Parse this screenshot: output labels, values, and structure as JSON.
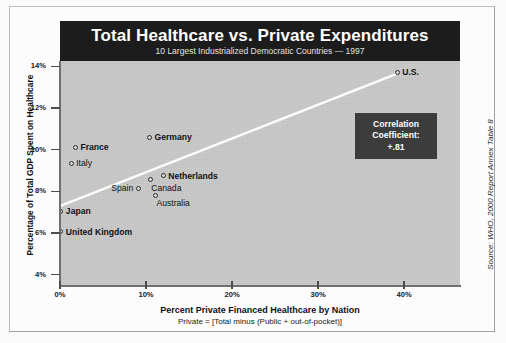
{
  "chart_data": {
    "type": "scatter",
    "title": "Total Healthcare vs. Private Expenditures",
    "subtitle": "10 Largest Industrialized Democratic Countries — 1997",
    "xlabel": "Percent Private Financed Healthcare by Nation",
    "xnote": "Private = [Total minus (Public + out-of-pocket)]",
    "ylabel": "Percentage of Total GDP Spent on Healthcare",
    "source": "Source: WHO, 2000 Report Annex Table 8",
    "xlim": [
      0,
      46.5
    ],
    "ylim": [
      3.5,
      14.25
    ],
    "grid": false,
    "legend": "none",
    "xticks": [
      "0%",
      "10%",
      "20%",
      "30%",
      "40%"
    ],
    "xtick_values": [
      0,
      10,
      20,
      30,
      40
    ],
    "yticks": [
      "4%",
      "6%",
      "8%",
      "10%",
      "12%",
      "14%"
    ],
    "ytick_values": [
      4,
      6,
      8,
      10,
      12,
      14
    ],
    "points": [
      {
        "label": "U.S.",
        "x": 39.2,
        "y": 13.7,
        "bold": true,
        "label_pos": "right"
      },
      {
        "label": "Germany",
        "x": 10.4,
        "y": 10.6,
        "bold": true,
        "label_pos": "right"
      },
      {
        "label": "France",
        "x": 1.8,
        "y": 10.1,
        "bold": true,
        "label_pos": "right"
      },
      {
        "label": "Italy",
        "x": 1.3,
        "y": 9.35,
        "bold": false,
        "label_pos": "right"
      },
      {
        "label": "Netherlands",
        "x": 12.0,
        "y": 8.75,
        "bold": true,
        "label_pos": "right"
      },
      {
        "label": "Canada",
        "x": 10.5,
        "y": 8.55,
        "bold": false,
        "label_pos": "below-right"
      },
      {
        "label": "Spain",
        "x": 9.1,
        "y": 8.15,
        "bold": false,
        "label_pos": "left"
      },
      {
        "label": "Australia",
        "x": 11.1,
        "y": 7.8,
        "bold": false,
        "label_pos": "below-right"
      },
      {
        "label": "Japan",
        "x": 0.1,
        "y": 7.05,
        "bold": true,
        "label_pos": "right"
      },
      {
        "label": "United Kingdom",
        "x": 0.1,
        "y": 6.05,
        "bold": true,
        "label_pos": "right"
      }
    ],
    "trendline": {
      "x0": 0.0,
      "y0": 7.3,
      "x1": 39.2,
      "y1": 13.65
    },
    "annotation": {
      "line1": "Correlation",
      "line2": "Coefficient:",
      "line3": "+.81"
    }
  },
  "colors": {
    "plot_background": "#c9c9c9",
    "title_background": "#1c1c1c",
    "title_text": "#ffffff",
    "annotation_background": "#3c3c3c",
    "trendline": "#fdfdfd",
    "marker_stroke": "#2a2a2a",
    "axis": "#6e7174"
  }
}
